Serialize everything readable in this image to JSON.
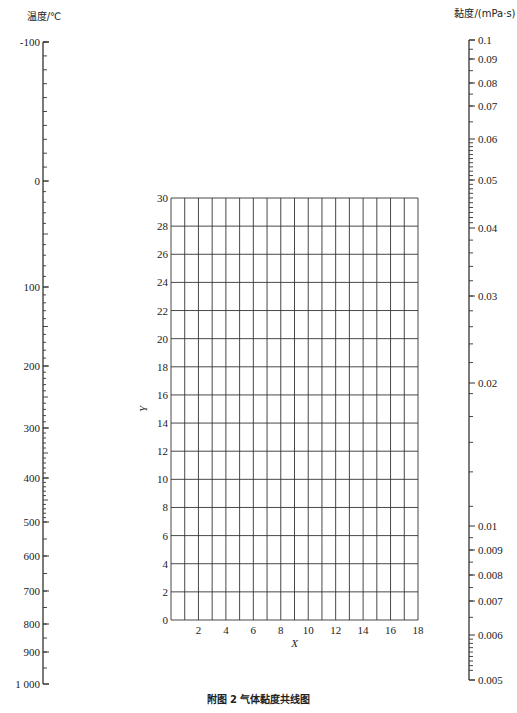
{
  "caption": "附图 2   气体黏度共线图",
  "chart_data": {
    "type": "nomogram",
    "title": "气体黏度共线图",
    "figure_label": "附图 2",
    "left_axis": {
      "label": "温度/℃",
      "ticks": [
        {
          "label": "-100",
          "value": -100,
          "y": 42
        },
        {
          "label": "0",
          "value": 0,
          "y": 181
        },
        {
          "label": "100",
          "value": 100,
          "y": 287
        },
        {
          "label": "200",
          "value": 200,
          "y": 366
        },
        {
          "label": "300",
          "value": 300,
          "y": 428
        },
        {
          "label": "400",
          "value": 400,
          "y": 478
        },
        {
          "label": "500",
          "value": 500,
          "y": 522
        },
        {
          "label": "600",
          "value": 600,
          "y": 556
        },
        {
          "label": "700",
          "value": 700,
          "y": 591
        },
        {
          "label": "800",
          "value": 800,
          "y": 624
        },
        {
          "label": "900",
          "value": 900,
          "y": 652
        },
        {
          "label": "1 000",
          "value": 1000,
          "y": 684
        }
      ]
    },
    "right_axis": {
      "label": "黏度/(mPa·s)",
      "ticks": [
        {
          "label": "0.1",
          "value": 0.1,
          "y": 40
        },
        {
          "label": "0.09",
          "value": 0.09,
          "y": 59
        },
        {
          "label": "0.08",
          "value": 0.08,
          "y": 83
        },
        {
          "label": "0.07",
          "value": 0.07,
          "y": 106
        },
        {
          "label": "0.06",
          "value": 0.06,
          "y": 139
        },
        {
          "label": "0.05",
          "value": 0.05,
          "y": 180
        },
        {
          "label": "0.04",
          "value": 0.04,
          "y": 228
        },
        {
          "label": "0.03",
          "value": 0.03,
          "y": 296
        },
        {
          "label": "0.02",
          "value": 0.02,
          "y": 383
        },
        {
          "label": "0.01",
          "value": 0.01,
          "y": 526
        },
        {
          "label": "0.009",
          "value": 0.009,
          "y": 550
        },
        {
          "label": "0.008",
          "value": 0.008,
          "y": 575
        },
        {
          "label": "0.007",
          "value": 0.007,
          "y": 601
        },
        {
          "label": "0.006",
          "value": 0.006,
          "y": 635
        },
        {
          "label": "0.005",
          "value": 0.005,
          "y": 680
        }
      ]
    },
    "grid": {
      "xlabel": "X",
      "ylabel": "Y",
      "xlim": [
        0,
        18
      ],
      "ylim": [
        0,
        30
      ],
      "x_step": 1,
      "y_step": 2,
      "x_tick_labels": [
        "2",
        "4",
        "6",
        "8",
        "10",
        "12",
        "14",
        "16",
        "18"
      ],
      "y_tick_labels": [
        "0",
        "2",
        "4",
        "6",
        "8",
        "10",
        "12",
        "14",
        "16",
        "18",
        "20",
        "22",
        "24",
        "26",
        "28",
        "30"
      ],
      "grid_on": true
    }
  }
}
